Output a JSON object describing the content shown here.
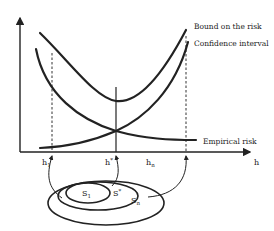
{
  "diagram": {
    "curves": [
      {
        "id": "bound",
        "label": "Bound on the risk"
      },
      {
        "id": "confidence",
        "label": "Confidence interval"
      },
      {
        "id": "empirical",
        "label": "Empirical risk"
      }
    ],
    "x_axis": {
      "label": "h",
      "ticks": [
        {
          "id": "h1",
          "base": "h",
          "sub": "1",
          "sup": ""
        },
        {
          "id": "hstar",
          "base": "h",
          "sub": "",
          "sup": "*"
        },
        {
          "id": "hn",
          "base": "h",
          "sub": "n",
          "sup": ""
        }
      ]
    },
    "nested_sets": [
      {
        "id": "S1",
        "base": "S",
        "sub": "1",
        "sup": ""
      },
      {
        "id": "Sstar",
        "base": "S",
        "sub": "",
        "sup": "*"
      },
      {
        "id": "Sn",
        "base": "S",
        "sub": "n",
        "sup": ""
      }
    ],
    "colors": {
      "ink": "#222222",
      "background": "#ffffff"
    }
  }
}
